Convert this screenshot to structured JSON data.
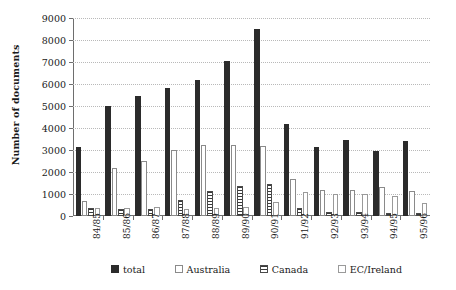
{
  "chart_data": {
    "type": "bar",
    "title": "",
    "subtitle": "",
    "xlabel": "",
    "ylabel": "Number of documents",
    "ylim": [
      0,
      9000
    ],
    "ytick_step": 1000,
    "yticks": [
      0,
      1000,
      2000,
      3000,
      4000,
      5000,
      6000,
      7000,
      8000,
      9000
    ],
    "ytick_labels": [
      "0",
      "1000",
      "2000",
      "3000",
      "4000",
      "5000",
      "6000",
      "7000",
      "8000",
      "9000"
    ],
    "grid": true,
    "grid_style": "dotted-horizontal",
    "legend_position": "bottom",
    "categories": [
      "84/85",
      "85/86",
      "86/87",
      "87/88",
      "88/89",
      "89/90",
      "90/91",
      "91/92",
      "92/93",
      "93/94",
      "94/95",
      "95/96"
    ],
    "series": [
      {
        "name": "total",
        "style": "solid-black",
        "color": "#2b2b2b",
        "values": [
          3150,
          5000,
          5450,
          5800,
          6200,
          7050,
          8500,
          4200,
          3150,
          3450,
          2950,
          3400
        ]
      },
      {
        "name": "Australia",
        "style": "outline-white",
        "color": "#ffffff",
        "values": [
          700,
          2200,
          2500,
          3000,
          3250,
          3250,
          3200,
          1700,
          1200,
          1200,
          1300,
          1150
        ]
      },
      {
        "name": "Canada",
        "style": "horizontal-hatch",
        "color": "#3a3a3a",
        "values": [
          350,
          300,
          300,
          750,
          1150,
          1350,
          1450,
          350,
          200,
          200,
          150,
          150
        ]
      },
      {
        "name": "EC/Ireland",
        "style": "outline-white",
        "color": "#ffffff",
        "values": [
          350,
          380,
          400,
          300,
          350,
          400,
          650,
          1100,
          1000,
          1000,
          900,
          600
        ]
      }
    ]
  },
  "legend": {
    "items": [
      {
        "label": "total",
        "swatch": "total"
      },
      {
        "label": "Australia",
        "swatch": "australia"
      },
      {
        "label": "Canada",
        "swatch": "canada"
      },
      {
        "label": "EC/Ireland",
        "swatch": "ec"
      }
    ]
  }
}
